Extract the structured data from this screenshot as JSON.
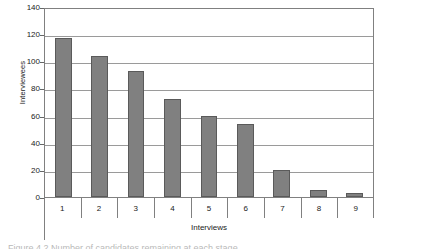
{
  "chart_data": {
    "type": "bar",
    "title": "",
    "xlabel": "Interviews",
    "ylabel": "Interviewees",
    "categories": [
      "1",
      "2",
      "3",
      "4",
      "5",
      "6",
      "7",
      "8",
      "9"
    ],
    "values": [
      117,
      104,
      93,
      72,
      60,
      54,
      20,
      5,
      3
    ],
    "ylim": [
      0,
      140
    ],
    "ytick_labels": [
      "0",
      "20",
      "40",
      "60",
      "80",
      "100",
      "120",
      "140"
    ],
    "ytick_values": [
      0,
      20,
      40,
      60,
      80,
      100,
      120,
      140
    ],
    "grid": "horizontal",
    "legend": "none",
    "bar_color": "#808080",
    "bar_edge_color": "#5a5a5a",
    "gridline_color": "#9a9a9a",
    "axis_color": "#808080",
    "plot_background": "#ffffff"
  },
  "caption": {
    "cropped_text": "Figure 4.2  Number of candidates remaining at each stage"
  }
}
